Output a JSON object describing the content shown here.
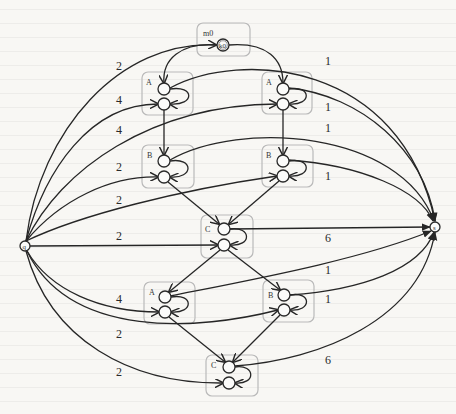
{
  "diagram": {
    "type": "weighted directed graph with grouped state boxes",
    "endpoints": {
      "source": {
        "label": "q"
      },
      "sink": {
        "label": "s"
      }
    },
    "start_box": {
      "label": "m0",
      "node_label": "k0"
    },
    "boxes": [
      {
        "id": "A1",
        "label": "A"
      },
      {
        "id": "A2",
        "label": "A"
      },
      {
        "id": "B1",
        "label": "B"
      },
      {
        "id": "B2",
        "label": "B"
      },
      {
        "id": "C1",
        "label": "C"
      },
      {
        "id": "A3",
        "label": "A"
      },
      {
        "id": "B3",
        "label": "B"
      },
      {
        "id": "C2",
        "label": "C"
      }
    ],
    "left_weights": [
      "2",
      "4",
      "4",
      "2",
      "2",
      "2",
      "4",
      "2",
      "2"
    ],
    "right_weights": [
      "1",
      "1",
      "1",
      "1",
      "6",
      "1",
      "1",
      "6"
    ],
    "edges": [
      {
        "from": "q",
        "to": "k0",
        "weight": "2"
      },
      {
        "from": "q",
        "to": "A1.bottom",
        "weight": "4"
      },
      {
        "from": "q",
        "to": "A2.bottom",
        "weight": "4"
      },
      {
        "from": "q",
        "to": "B1.bottom",
        "weight": "2"
      },
      {
        "from": "q",
        "to": "B2.bottom",
        "weight": "2"
      },
      {
        "from": "q",
        "to": "C1.bottom",
        "weight": "2"
      },
      {
        "from": "q",
        "to": "A3.bottom",
        "weight": "4"
      },
      {
        "from": "q",
        "to": "B3.bottom",
        "weight": "2"
      },
      {
        "from": "q",
        "to": "C2.bottom",
        "weight": "2"
      },
      {
        "from": "A1.top",
        "to": "s",
        "weight": "1"
      },
      {
        "from": "A2.top",
        "to": "s",
        "weight": "1"
      },
      {
        "from": "B1.top",
        "to": "s",
        "weight": "1"
      },
      {
        "from": "B2.top",
        "to": "s",
        "weight": "1"
      },
      {
        "from": "C1.top",
        "to": "s",
        "weight": "6"
      },
      {
        "from": "A3.top",
        "to": "s",
        "weight": "1"
      },
      {
        "from": "B3.top",
        "to": "s",
        "weight": "1"
      },
      {
        "from": "C2.top",
        "to": "s",
        "weight": "6"
      },
      {
        "from": "k0",
        "to": "A1.top"
      },
      {
        "from": "k0",
        "to": "A2.top"
      },
      {
        "from": "A1.bottom",
        "to": "B1.top"
      },
      {
        "from": "A2.bottom",
        "to": "B2.top"
      },
      {
        "from": "B1.bottom",
        "to": "C1.top"
      },
      {
        "from": "B2.bottom",
        "to": "C1.top"
      },
      {
        "from": "C1.bottom",
        "to": "A3.top"
      },
      {
        "from": "C1.bottom",
        "to": "B3.top"
      },
      {
        "from": "A3.bottom",
        "to": "C2.top"
      },
      {
        "from": "B3.bottom",
        "to": "C2.top"
      }
    ]
  }
}
